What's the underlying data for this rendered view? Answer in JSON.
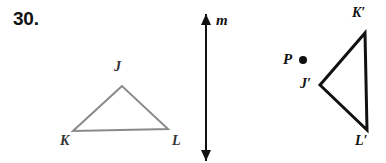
{
  "figure": {
    "problem_number": "30.",
    "width": 386,
    "height": 163,
    "background_color": "#ffffff"
  },
  "preimage_triangle": {
    "name": "triangle-JKL",
    "stroke_color": "#8a8a8a",
    "stroke_width": 2,
    "fill": "none",
    "vertices": [
      {
        "label": "J",
        "x": 122,
        "y": 86,
        "label_x": 114,
        "label_y": 60
      },
      {
        "label": "K",
        "x": 73,
        "y": 131,
        "label_x": 60,
        "label_y": 134
      },
      {
        "label": "L",
        "x": 168,
        "y": 129,
        "label_x": 172,
        "label_y": 134
      }
    ]
  },
  "line_of_reflection": {
    "name": "line-m",
    "label": "m",
    "stroke_color": "#111111",
    "stroke_width": 2,
    "x": 206,
    "y_top": 14,
    "y_bottom": 161,
    "label_x": 216,
    "label_y": 13,
    "arrowheads": "both"
  },
  "center_point": {
    "name": "point-P",
    "label": "P",
    "dot_x": 303,
    "dot_y": 60,
    "dot_radius": 4,
    "dot_color": "#111111",
    "label_x": 283,
    "label_y": 52
  },
  "image_triangle": {
    "name": "triangle-J-prime-K-prime-L-prime",
    "stroke_color": "#111111",
    "stroke_width": 3,
    "fill": "none",
    "vertices": [
      {
        "label": "J′",
        "x": 320,
        "y": 85,
        "label_x": 300,
        "label_y": 77
      },
      {
        "label": "K′",
        "x": 365,
        "y": 33,
        "label_x": 352,
        "label_y": 6
      },
      {
        "label": "L′",
        "x": 367,
        "y": 130,
        "label_x": 355,
        "label_y": 134
      }
    ]
  }
}
